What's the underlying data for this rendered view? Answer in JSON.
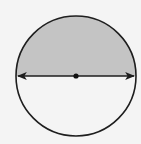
{
  "diagram": {
    "type": "circle-with-diameter",
    "circle": {
      "cx": 76,
      "cy": 76,
      "r": 60
    },
    "shaded_region": "upper-semicircle",
    "colors": {
      "background": "#f4f4f4",
      "shade": "#c4c4c4",
      "stroke": "#1e1e1e",
      "center_point": "#111111"
    },
    "diameter": {
      "orientation": "horizontal",
      "arrowheads": "both-ends"
    },
    "center_point": true
  }
}
